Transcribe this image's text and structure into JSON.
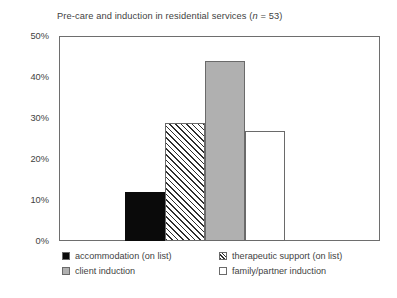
{
  "chart_data": {
    "type": "bar",
    "title": "Pre-care and induction in residential services (n = 53)",
    "title_prefix": "Pre-care and induction in residential services (",
    "title_italic": "n",
    "title_suffix": " = 53)",
    "sample_size": 53,
    "xlabel": "",
    "ylabel": "",
    "ylim": [
      0,
      50
    ],
    "y_unit": "%",
    "grid": false,
    "legend_position": "bottom",
    "categories": [
      "accommodation (on list)",
      "therapeutic support (on list)",
      "client induction",
      "family/partner induction"
    ],
    "values": [
      12,
      29,
      44,
      27
    ],
    "value_labels": [
      "12%",
      "29%",
      "44%",
      "27%"
    ],
    "y_ticks": [
      0,
      10,
      20,
      30,
      40,
      50
    ],
    "y_tick_labels": [
      "0%",
      "10%",
      "20%",
      "30%",
      "40%",
      "50%"
    ],
    "bar_styles": [
      "solid-black",
      "diagonal-hatch",
      "solid-gray",
      "solid-white"
    ],
    "colors": {
      "accommodation": "#0a0a0a",
      "therapeutic_support": "#ffffff",
      "client_induction": "#b0b0b0",
      "family_partner_induction": "#ffffff",
      "axis": "#6e6e6e",
      "text": "#3f3f3f",
      "background": "#ffffff"
    }
  },
  "legend": {
    "items": [
      {
        "label": "accommodation (on list)",
        "swatch": "solid-black-swatch"
      },
      {
        "label": "therapeutic support (on list)",
        "swatch": "hatch-swatch"
      },
      {
        "label": "client induction",
        "swatch": "solid-gray-swatch"
      },
      {
        "label": "family/partner induction",
        "swatch": "solid-white-swatch"
      }
    ]
  }
}
